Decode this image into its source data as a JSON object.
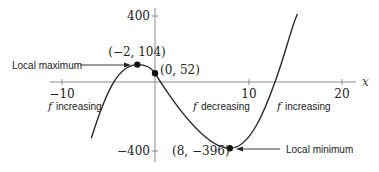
{
  "figure": {
    "function": "f(x) = x^3 - 9x^2 - 48x + 52",
    "axes": {
      "x_label": "x",
      "x_ticks": [
        {
          "value": -10,
          "label": "−10"
        },
        {
          "value": 10,
          "label": "10"
        },
        {
          "value": 20,
          "label": "20"
        }
      ],
      "y_ticks": [
        {
          "value": 400,
          "label": "400"
        },
        {
          "value": -400,
          "label": "−400"
        }
      ]
    },
    "points": [
      {
        "name": "local-max-point",
        "label": "(−2, 104)",
        "x": -2,
        "y": 104
      },
      {
        "name": "y-intercept-point",
        "label": "(0, 52)",
        "x": 0,
        "y": 52
      },
      {
        "name": "local-min-point",
        "label": "(8, −396)",
        "x": 8,
        "y": -396
      }
    ],
    "annotations": {
      "local_max": "Local maximum",
      "local_min": "Local minimum",
      "region_left": "increasing",
      "region_middle": "decreasing",
      "region_right": "increasing",
      "f_symbol": "f"
    },
    "colors": {
      "curve": "#2a2a2a",
      "axis": "#8a8a8a",
      "text": "#222222"
    }
  }
}
